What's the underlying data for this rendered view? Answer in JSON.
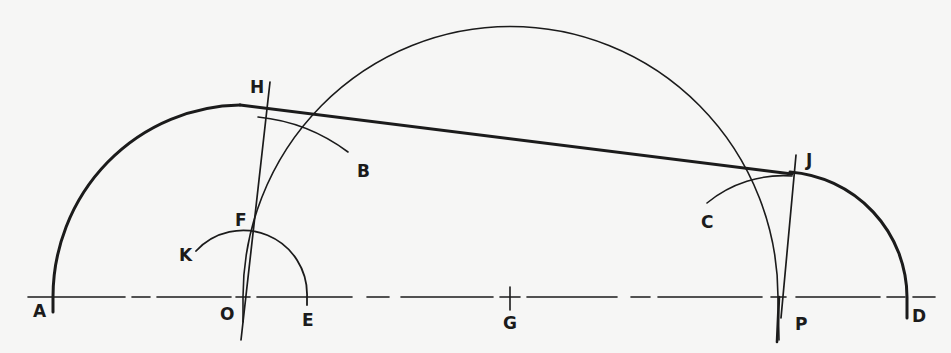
{
  "diagram": {
    "type": "geometric-construction",
    "colors": {
      "background": "#f6f6f5",
      "ink": "#1b1b1b"
    },
    "baseline": {
      "y": 297,
      "x_start": 28,
      "x_end": 935,
      "style": "dashed"
    },
    "labels": {
      "A": "A",
      "B": "B",
      "C": "C",
      "D": "D",
      "E": "E",
      "F": "F",
      "G": "G",
      "H": "H",
      "J": "J",
      "K": "K",
      "O": "O",
      "P": "P"
    },
    "points": {
      "A": [
        53,
        297
      ],
      "O": [
        243,
        297
      ],
      "E": [
        307,
        297
      ],
      "G": [
        510,
        297
      ],
      "P": [
        779,
        297
      ],
      "D": [
        907,
        297
      ],
      "F": [
        250,
        232
      ],
      "H": [
        270,
        82
      ],
      "J": [
        796,
        155
      ]
    },
    "arcs": [
      {
        "name": "arc-AH",
        "center": "O",
        "radius": 190,
        "weight": "thick"
      },
      {
        "name": "arc-KE",
        "center": "O",
        "radius": 64,
        "weight": "thin"
      },
      {
        "name": "arc-B",
        "center": "O",
        "radius": 180,
        "weight": "thin"
      },
      {
        "name": "semicircle-G",
        "center": "G",
        "radius": 270,
        "weight": "thin"
      },
      {
        "name": "arc-JD",
        "center": "P",
        "radius": 127,
        "weight": "thick"
      },
      {
        "name": "arc-C",
        "center": "P",
        "radius": 120,
        "weight": "thin"
      }
    ],
    "lines": [
      {
        "name": "tangent-line",
        "from": [
          240,
          105
        ],
        "to": [
          815,
          178
        ],
        "weight": "thick"
      },
      {
        "name": "line-OH",
        "from": [
          270,
          82
        ],
        "to": [
          241,
          340
        ],
        "weight": "thin"
      },
      {
        "name": "line-PJ",
        "from": [
          796,
          155
        ],
        "to": [
          781,
          318
        ],
        "weight": "thin"
      }
    ]
  }
}
